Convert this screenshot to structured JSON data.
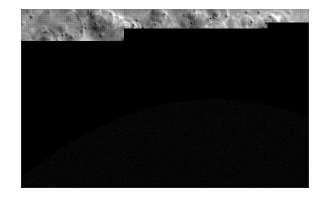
{
  "page": {
    "background_color": "#ffffff",
    "width": 329,
    "height": 203
  },
  "photo": {
    "title": "Cratered icy moon surface near the terminator",
    "media_type": "grayscale planetary surface photograph",
    "frame": {
      "left": 21,
      "top": 9,
      "width": 288,
      "height": 179
    },
    "palette": {
      "shadow_black": "#040404",
      "deep_shadow": "#121212",
      "terrain_dark": "#4e4e4e",
      "terrain_mid": "#8c8c8c",
      "terrain_light": "#b4b4b4",
      "highlight": "#e2e2e2",
      "specular": "#f2f2f2",
      "border_white": "#ffffff"
    },
    "regions": [
      {
        "name": "upper-left-cratered-plateau",
        "tone": "mid-gray",
        "description": "dense overlapping craters with soft rims"
      },
      {
        "name": "central-crater-field",
        "tone": "mid-gray",
        "description": "many small bowl craters with bright rims and dark interior shadows"
      },
      {
        "name": "right-bright-terrain",
        "tone": "light-gray",
        "description": "brighter mottled terrain with fresh bright ejecta spots"
      },
      {
        "name": "lower-left-terminator",
        "tone": "black",
        "description": "unlit night side; crater rims catch grazing light"
      },
      {
        "name": "limb-arc",
        "tone": "black",
        "description": "curved shadow boundary rising from lower-left to the right edge"
      }
    ],
    "lighting": {
      "sun_direction": "upper right",
      "terminator": "runs from mid-left edge, dips through the lower-centre, and rises to the right edge"
    }
  }
}
